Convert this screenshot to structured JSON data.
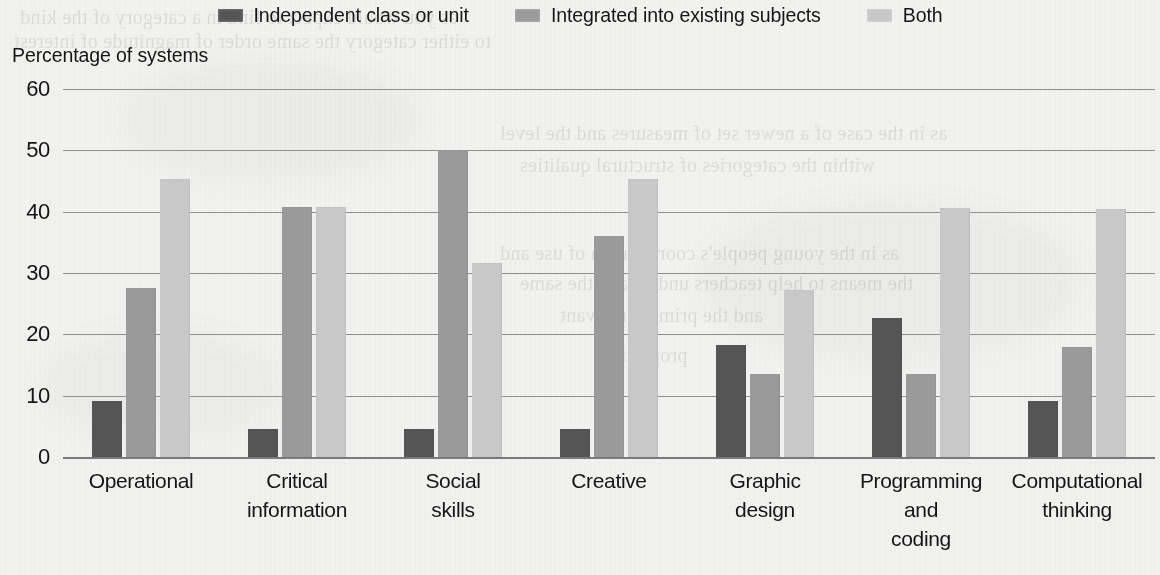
{
  "chart_data": {
    "type": "bar",
    "title": "",
    "ylabel": "Percentage of systems",
    "xlabel": "",
    "ylim": [
      0,
      60
    ],
    "yticks": [
      "0",
      "10",
      "20",
      "30",
      "40",
      "50",
      "60"
    ],
    "grid": true,
    "legend_position": "top-center",
    "categories": [
      "Operational",
      "Critical information",
      "Social skills",
      "Creative",
      "Graphic design",
      "Programming and coding",
      "Computational thinking"
    ],
    "category_lines": [
      [
        "Operational"
      ],
      [
        "Critical",
        "information"
      ],
      [
        "Social",
        "skills"
      ],
      [
        "Creative"
      ],
      [
        "Graphic",
        "design"
      ],
      [
        "Programming",
        "and",
        "coding"
      ],
      [
        "Computational",
        "thinking"
      ]
    ],
    "series": [
      {
        "name": "Independent class or unit",
        "color": "#555555",
        "values": [
          9.2,
          4.6,
          4.6,
          4.5,
          18.3,
          22.6,
          9.1
        ]
      },
      {
        "name": "Integrated into existing subjects",
        "color": "#9a9a9a",
        "values": [
          27.5,
          40.8,
          50.0,
          36.1,
          13.6,
          13.5,
          18.0
        ]
      },
      {
        "name": "Both",
        "color": "#c8c8c8",
        "values": [
          45.4,
          40.7,
          31.7,
          45.3,
          27.2,
          40.6,
          40.5
        ]
      }
    ]
  },
  "legend": {
    "items": [
      {
        "label": "Independent class or unit",
        "color": "#555555"
      },
      {
        "label": "Integrated into existing subjects",
        "color": "#9a9a9a"
      },
      {
        "label": "Both",
        "color": "#c8c8c8"
      }
    ]
  },
  "ghost_text": [
    {
      "text": "as you would expect to find in a category of the kind",
      "x": 20,
      "y": 2
    },
    {
      "text": "to either category the same order of magnitude of  interest",
      "x": 14,
      "y": 26
    },
    {
      "text": "as in the case of a newer set of measures and the level",
      "x": 500,
      "y": 118
    },
    {
      "text": "within the categories of structural qualities",
      "x": 520,
      "y": 150
    },
    {
      "text": "as in the young people's coordination of use and",
      "x": 500,
      "y": 238
    },
    {
      "text": "the means to help teachers understand the same",
      "x": 520,
      "y": 268
    },
    {
      "text": "and the primary relevant",
      "x": 560,
      "y": 300
    },
    {
      "text": "proportion",
      "x": 600,
      "y": 340
    }
  ]
}
